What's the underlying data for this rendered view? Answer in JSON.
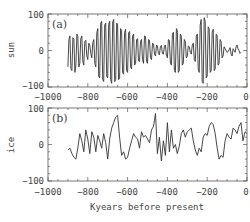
{
  "chart_data": [
    {
      "type": "line",
      "panel_label": "(a)",
      "ylabel": "sun",
      "xlabel": "",
      "xlim": [
        -1000,
        0
      ],
      "ylim": [
        -100,
        100
      ],
      "xticks": [
        -1000,
        -800,
        -600,
        -400,
        -200,
        0
      ],
      "yticks": [
        -100,
        0,
        100
      ],
      "grid": false,
      "series": [
        {
          "name": "sun",
          "x": [
            -900,
            -895,
            -890,
            -885,
            -880,
            -875,
            -870,
            -865,
            -860,
            -855,
            -850,
            -845,
            -840,
            -835,
            -830,
            -825,
            -820,
            -815,
            -810,
            -805,
            -800,
            -795,
            -790,
            -785,
            -780,
            -775,
            -770,
            -765,
            -760,
            -755,
            -750,
            -745,
            -740,
            -735,
            -730,
            -725,
            -720,
            -715,
            -710,
            -705,
            -700,
            -695,
            -690,
            -685,
            -680,
            -675,
            -670,
            -665,
            -660,
            -655,
            -650,
            -645,
            -640,
            -635,
            -630,
            -625,
            -620,
            -615,
            -610,
            -605,
            -600,
            -595,
            -590,
            -585,
            -580,
            -575,
            -570,
            -565,
            -560,
            -555,
            -550,
            -545,
            -540,
            -535,
            -530,
            -525,
            -520,
            -515,
            -510,
            -505,
            -500,
            -495,
            -490,
            -485,
            -480,
            -475,
            -470,
            -465,
            -460,
            -455,
            -450,
            -445,
            -440,
            -435,
            -430,
            -425,
            -420,
            -415,
            -410,
            -405,
            -400,
            -395,
            -390,
            -385,
            -380,
            -375,
            -370,
            -365,
            -360,
            -355,
            -350,
            -345,
            -340,
            -335,
            -330,
            -325,
            -320,
            -315,
            -310,
            -305,
            -300,
            -295,
            -290,
            -285,
            -280,
            -275,
            -270,
            -265,
            -260,
            -255,
            -250,
            -245,
            -240,
            -235,
            -230,
            -225,
            -220,
            -215,
            -210,
            -205,
            -200,
            -195,
            -190,
            -185,
            -180,
            -175,
            -170,
            -165,
            -160,
            -155,
            -150,
            -145,
            -140,
            -135,
            -130,
            -125,
            -120,
            -115,
            -110,
            -100,
            -95,
            -90,
            -85,
            -80,
            -75,
            -70,
            -65,
            -60,
            -55,
            -50,
            -45,
            -40,
            -35,
            -30,
            -25,
            -20,
            -15,
            -10,
            -5,
            0
          ],
          "values": [
            -45,
            30,
            40,
            -50,
            -55,
            35,
            30,
            -60,
            -40,
            45,
            38,
            -45,
            -35,
            32,
            40,
            -30,
            -40,
            25,
            28,
            -15,
            -25,
            20,
            15,
            -8,
            -20,
            22,
            30,
            -35,
            -45,
            48,
            60,
            -70,
            -75,
            75,
            80,
            -80,
            -85,
            70,
            75,
            -70,
            -75,
            72,
            80,
            -80,
            -90,
            78,
            85,
            -85,
            -80,
            75,
            70,
            -80,
            -75,
            60,
            55,
            -60,
            -65,
            50,
            58,
            -55,
            -60,
            48,
            52,
            -45,
            -50,
            40,
            45,
            -40,
            -35,
            30,
            32,
            -28,
            -30,
            25,
            30,
            -25,
            -35,
            40,
            38,
            -30,
            -35,
            30,
            28,
            -20,
            -25,
            20,
            18,
            -10,
            -15,
            15,
            12,
            -8,
            -12,
            10,
            14,
            -8,
            -10,
            12,
            15,
            -12,
            -20,
            30,
            28,
            -35,
            -40,
            45,
            50,
            -55,
            -60,
            60,
            55,
            -60,
            -55,
            45,
            40,
            -40,
            -35,
            30,
            25,
            -20,
            -15,
            12,
            10,
            -5,
            -10,
            15,
            20,
            -25,
            -30,
            40,
            45,
            -50,
            -60,
            70,
            85,
            -85,
            -90,
            90,
            80,
            -75,
            -70,
            65,
            60,
            -60,
            -55,
            50,
            58,
            -55,
            -50,
            45,
            40,
            -40,
            -35,
            30,
            25,
            -20,
            -15,
            10,
            5,
            -5,
            -3,
            2,
            8,
            -10,
            -15,
            5,
            0,
            -5,
            10,
            15,
            5,
            0,
            -8,
            -5
          ],
          "note": "Approximate oscillating solar forcing signal, amplitude ~±90, beginning near -900 kyr"
        }
      ]
    },
    {
      "type": "line",
      "panel_label": "(b)",
      "ylabel": "ice",
      "xlabel": "Kyears before present",
      "xlim": [
        -1000,
        0
      ],
      "ylim": [
        -100,
        100
      ],
      "xticks": [
        -1000,
        -800,
        -600,
        -400,
        -200,
        0
      ],
      "yticks": [
        -100,
        0,
        100
      ],
      "grid": false,
      "series": [
        {
          "name": "ice",
          "x": [
            -900,
            -890,
            -880,
            -870,
            -860,
            -850,
            -840,
            -830,
            -820,
            -810,
            -800,
            -790,
            -780,
            -770,
            -760,
            -750,
            -740,
            -730,
            -720,
            -710,
            -700,
            -690,
            -680,
            -670,
            -660,
            -650,
            -640,
            -630,
            -620,
            -610,
            -600,
            -590,
            -580,
            -570,
            -560,
            -550,
            -540,
            -530,
            -520,
            -510,
            -500,
            -490,
            -480,
            -470,
            -460,
            -450,
            -440,
            -430,
            -420,
            -410,
            -400,
            -390,
            -380,
            -370,
            -360,
            -350,
            -340,
            -330,
            -320,
            -310,
            -300,
            -290,
            -280,
            -270,
            -260,
            -250,
            -240,
            -230,
            -220,
            -210,
            -200,
            -190,
            -180,
            -170,
            -160,
            -150,
            -140,
            -130,
            -120,
            -110,
            -100,
            -90,
            -80,
            -70,
            -60,
            -50,
            -40,
            -30,
            -20,
            -10,
            0
          ],
          "values": [
            -15,
            -10,
            -25,
            -35,
            -40,
            -10,
            30,
            10,
            -20,
            40,
            15,
            -25,
            35,
            20,
            -20,
            25,
            10,
            -10,
            30,
            5,
            -40,
            15,
            45,
            60,
            75,
            80,
            20,
            -30,
            -20,
            -40,
            -35,
            -10,
            10,
            30,
            20,
            15,
            -10,
            35,
            20,
            25,
            15,
            5,
            40,
            50,
            85,
            -25,
            20,
            -45,
            10,
            -30,
            60,
            -20,
            40,
            -10,
            0,
            -25,
            -5,
            30,
            40,
            20,
            35,
            40,
            45,
            10,
            -15,
            -30,
            -10,
            -20,
            20,
            30,
            25,
            50,
            60,
            55,
            30,
            -10,
            -40,
            -30,
            -35,
            10,
            30,
            20,
            15,
            45,
            40,
            30,
            50,
            60,
            10,
            35,
            30
          ],
          "note": "Approximate simulated ice volume record, beginning near -900 kyr"
        }
      ]
    }
  ],
  "panels": {
    "a": {
      "label": "(a)",
      "ylabel": "sun"
    },
    "b": {
      "label": "(b)",
      "ylabel": "ice"
    }
  },
  "axes": {
    "xtick_labels": [
      "−1000",
      "−800",
      "−600",
      "−400",
      "−200",
      "0"
    ],
    "ytick_labels": [
      "100",
      "0",
      "−100"
    ],
    "xlabel": "Kyears before present"
  }
}
